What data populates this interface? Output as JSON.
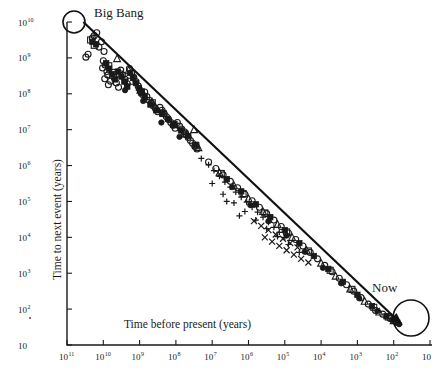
{
  "chart_data": {
    "type": "scatter",
    "title": "",
    "xlabel": "Time before present (years)",
    "ylabel": "Time to next event (years)",
    "xscale": "log",
    "yscale": "log",
    "x_reversed": true,
    "xlim": [
      11,
      1
    ],
    "ylim": [
      1,
      10
    ],
    "grid": false,
    "legend": false,
    "x_tick_labels": [
      "10¹¹",
      "10¹⁰",
      "10⁹",
      "10⁸",
      "10⁷",
      "10⁶",
      "10⁵",
      "10⁴",
      "10³",
      "10²",
      "10"
    ],
    "x_tick_exponents": [
      "11",
      "10",
      "9",
      "8",
      "7",
      "6",
      "5",
      "4",
      "3",
      "2",
      ""
    ],
    "y_tick_labels": [
      "10¹⁰",
      "10⁹",
      "10⁸",
      "10⁷",
      "10⁶",
      "10⁵",
      "10⁴",
      "10³",
      "10²",
      "10"
    ],
    "y_tick_exponents": [
      "10",
      "9",
      "8",
      "7",
      "6",
      "5",
      "4",
      "3",
      "2",
      ""
    ],
    "annotations": [
      {
        "name": "big-bang",
        "label": "Big Bang",
        "x": 10.6,
        "y": 10.0
      },
      {
        "name": "now",
        "label": "Now",
        "x": 1.6,
        "y": 1.45
      }
    ],
    "trend_line": {
      "description": "diagonal trend line from Big Bang to Now",
      "x_start": 10.55,
      "y_start": 10.0,
      "x_end": 1.75,
      "y_end": 1.55
    },
    "series": [
      {
        "name": "open-circle",
        "marker": "circle-open",
        "points": [
          [
            10.25,
            9.62
          ],
          [
            10.18,
            9.7
          ],
          [
            10.3,
            9.55
          ],
          [
            10.05,
            9.45
          ],
          [
            10.42,
            9.1
          ],
          [
            10.48,
            9.02
          ],
          [
            10.12,
            9.3
          ],
          [
            9.98,
            9.18
          ],
          [
            10.0,
            8.92
          ],
          [
            9.95,
            8.8
          ],
          [
            10.02,
            8.72
          ],
          [
            9.9,
            8.62
          ],
          [
            9.88,
            8.52
          ],
          [
            9.96,
            8.42
          ],
          [
            9.8,
            8.35
          ],
          [
            9.86,
            8.25
          ],
          [
            9.72,
            8.6
          ],
          [
            9.7,
            8.45
          ],
          [
            9.64,
            8.3
          ],
          [
            9.58,
            8.18
          ],
          [
            9.52,
            8.66
          ],
          [
            9.46,
            8.52
          ],
          [
            9.4,
            8.4
          ],
          [
            9.34,
            8.28
          ],
          [
            9.28,
            8.7
          ],
          [
            9.22,
            8.58
          ],
          [
            9.16,
            8.46
          ],
          [
            9.1,
            8.34
          ],
          [
            9.04,
            8.22
          ],
          [
            8.98,
            8.1
          ],
          [
            8.92,
            7.98
          ],
          [
            8.86,
            8.05
          ],
          [
            8.8,
            7.92
          ],
          [
            8.74,
            7.82
          ],
          [
            8.68,
            7.74
          ],
          [
            8.62,
            7.66
          ],
          [
            8.56,
            7.58
          ],
          [
            8.5,
            7.5
          ],
          [
            8.44,
            7.62
          ],
          [
            8.38,
            7.54
          ],
          [
            8.32,
            7.44
          ],
          [
            8.26,
            7.36
          ],
          [
            8.2,
            7.28
          ],
          [
            8.14,
            7.2
          ],
          [
            8.08,
            7.12
          ],
          [
            8.02,
            7.04
          ],
          [
            7.96,
            7.2
          ],
          [
            7.9,
            7.1
          ],
          [
            7.84,
            7.02
          ],
          [
            7.78,
            6.94
          ],
          [
            7.72,
            6.86
          ],
          [
            7.66,
            6.78
          ],
          [
            7.6,
            6.7
          ],
          [
            7.54,
            6.62
          ],
          [
            7.48,
            6.54
          ],
          [
            7.42,
            6.46
          ],
          [
            7.1,
            6.1
          ],
          [
            6.9,
            5.92
          ],
          [
            6.7,
            5.74
          ],
          [
            6.5,
            5.56
          ],
          [
            6.3,
            5.38
          ],
          [
            6.1,
            5.2
          ],
          [
            5.9,
            5.02
          ],
          [
            5.7,
            4.84
          ],
          [
            5.5,
            4.66
          ],
          [
            5.3,
            4.48
          ],
          [
            5.1,
            4.3
          ],
          [
            4.9,
            4.12
          ],
          [
            4.7,
            3.94
          ],
          [
            4.5,
            3.76
          ],
          [
            4.3,
            3.58
          ],
          [
            4.1,
            3.4
          ],
          [
            3.9,
            3.22
          ],
          [
            3.7,
            3.04
          ],
          [
            3.5,
            2.86
          ],
          [
            3.3,
            2.68
          ],
          [
            3.1,
            2.5
          ],
          [
            2.9,
            2.32
          ],
          [
            2.7,
            2.14
          ],
          [
            2.5,
            1.96
          ],
          [
            2.3,
            1.86
          ],
          [
            2.1,
            1.74
          ],
          [
            1.95,
            1.66
          ]
        ]
      },
      {
        "name": "filled-square",
        "marker": "square-filled",
        "points": [
          [
            10.3,
            9.45
          ],
          [
            10.2,
            9.38
          ],
          [
            9.92,
            8.85
          ],
          [
            9.84,
            8.7
          ],
          [
            9.76,
            8.55
          ],
          [
            9.68,
            8.4
          ],
          [
            9.6,
            8.62
          ],
          [
            9.5,
            8.48
          ],
          [
            9.42,
            8.34
          ],
          [
            9.34,
            8.2
          ],
          [
            9.26,
            8.58
          ],
          [
            9.18,
            8.44
          ],
          [
            9.1,
            8.3
          ],
          [
            9.02,
            8.16
          ],
          [
            8.94,
            8.02
          ],
          [
            8.86,
            7.9
          ],
          [
            8.7,
            7.7
          ],
          [
            8.54,
            7.54
          ],
          [
            8.38,
            7.46
          ],
          [
            8.22,
            7.3
          ],
          [
            8.06,
            7.14
          ],
          [
            7.86,
            6.98
          ],
          [
            7.66,
            6.82
          ],
          [
            7.46,
            6.58
          ],
          [
            6.6,
            5.62
          ],
          [
            6.2,
            5.28
          ],
          [
            5.8,
            4.92
          ],
          [
            5.4,
            4.56
          ],
          [
            5.0,
            4.2
          ],
          [
            4.6,
            3.84
          ],
          [
            4.2,
            3.48
          ],
          [
            3.8,
            3.12
          ],
          [
            3.4,
            2.76
          ],
          [
            3.0,
            2.4
          ],
          [
            2.6,
            2.08
          ],
          [
            2.2,
            1.8
          ],
          [
            1.9,
            1.62
          ]
        ]
      },
      {
        "name": "triangle",
        "marker": "triangle-open",
        "points": [
          [
            9.62,
            8.98
          ],
          [
            9.3,
            8.66
          ],
          [
            8.98,
            8.1
          ],
          [
            8.66,
            7.78
          ],
          [
            8.34,
            7.46
          ],
          [
            8.02,
            7.14
          ],
          [
            7.7,
            6.9
          ],
          [
            7.38,
            6.5
          ],
          [
            7.5,
            7.0
          ],
          [
            6.8,
            5.8
          ],
          [
            6.4,
            5.44
          ],
          [
            6.0,
            5.08
          ],
          [
            5.6,
            4.72
          ],
          [
            5.2,
            4.36
          ],
          [
            4.8,
            4.0
          ],
          [
            4.4,
            3.64
          ],
          [
            4.0,
            3.28
          ],
          [
            3.6,
            2.92
          ],
          [
            3.2,
            2.56
          ],
          [
            2.8,
            2.22
          ],
          [
            2.4,
            1.92
          ],
          [
            2.0,
            1.68
          ]
        ]
      },
      {
        "name": "plus",
        "marker": "plus",
        "points": [
          [
            7.3,
            6.2
          ],
          [
            7.1,
            6.02
          ],
          [
            6.95,
            5.86
          ],
          [
            6.8,
            5.7
          ],
          [
            6.65,
            5.54
          ],
          [
            6.5,
            5.4
          ],
          [
            6.35,
            5.26
          ],
          [
            6.2,
            5.12
          ],
          [
            6.05,
            4.98
          ],
          [
            5.9,
            4.84
          ],
          [
            5.75,
            4.7
          ],
          [
            5.6,
            4.56
          ],
          [
            5.45,
            4.42
          ],
          [
            5.3,
            4.28
          ],
          [
            5.15,
            4.14
          ],
          [
            5.0,
            4.0
          ],
          [
            6.7,
            5.2
          ],
          [
            6.4,
            4.96
          ],
          [
            6.1,
            4.72
          ],
          [
            5.8,
            4.48
          ],
          [
            5.5,
            4.24
          ],
          [
            5.2,
            4.02
          ],
          [
            4.9,
            3.8
          ],
          [
            4.6,
            3.58
          ],
          [
            7.0,
            5.5
          ],
          [
            6.6,
            5.0
          ],
          [
            6.25,
            4.6
          ]
        ]
      },
      {
        "name": "x-mark",
        "marker": "x",
        "points": [
          [
            5.85,
            4.45
          ],
          [
            5.65,
            4.32
          ],
          [
            5.45,
            4.2
          ],
          [
            5.25,
            4.08
          ],
          [
            5.05,
            3.96
          ],
          [
            4.85,
            3.84
          ],
          [
            4.65,
            3.72
          ],
          [
            5.55,
            4.0
          ],
          [
            5.35,
            3.88
          ],
          [
            5.15,
            3.76
          ],
          [
            4.95,
            3.64
          ],
          [
            4.75,
            3.52
          ],
          [
            4.55,
            3.4
          ],
          [
            4.35,
            3.3
          ]
        ]
      },
      {
        "name": "filled-circle",
        "marker": "circle-filled",
        "points": [
          [
            9.4,
            8.1
          ],
          [
            8.9,
            7.8
          ],
          [
            8.4,
            7.2
          ],
          [
            7.9,
            6.8
          ],
          [
            6.45,
            5.4
          ],
          [
            5.95,
            4.9
          ],
          [
            5.45,
            4.45
          ],
          [
            4.95,
            4.05
          ],
          [
            4.45,
            3.6
          ],
          [
            3.95,
            3.15
          ],
          [
            3.45,
            2.72
          ],
          [
            2.95,
            2.3
          ],
          [
            2.45,
            1.95
          ],
          [
            2.05,
            1.7
          ],
          [
            1.85,
            1.58
          ]
        ]
      },
      {
        "name": "open-square",
        "marker": "square-open",
        "points": [
          [
            10.35,
            9.5
          ],
          [
            10.25,
            9.35
          ],
          [
            9.85,
            8.78
          ],
          [
            9.55,
            8.55
          ],
          [
            9.25,
            8.35
          ],
          [
            8.95,
            8.05
          ],
          [
            8.65,
            7.75
          ],
          [
            8.35,
            7.45
          ],
          [
            8.05,
            7.15
          ],
          [
            7.75,
            6.88
          ],
          [
            7.45,
            6.55
          ],
          [
            6.75,
            5.78
          ],
          [
            6.15,
            5.22
          ],
          [
            5.55,
            4.68
          ],
          [
            4.95,
            4.15
          ],
          [
            4.35,
            3.62
          ],
          [
            3.75,
            3.08
          ],
          [
            3.15,
            2.55
          ],
          [
            2.55,
            2.05
          ],
          [
            2.15,
            1.78
          ]
        ]
      }
    ]
  },
  "axes": {
    "x_title": "Time before present (years)",
    "y_title": "Time to next event (years)"
  },
  "labels": {
    "big_bang": "Big Bang",
    "now": "Now"
  }
}
